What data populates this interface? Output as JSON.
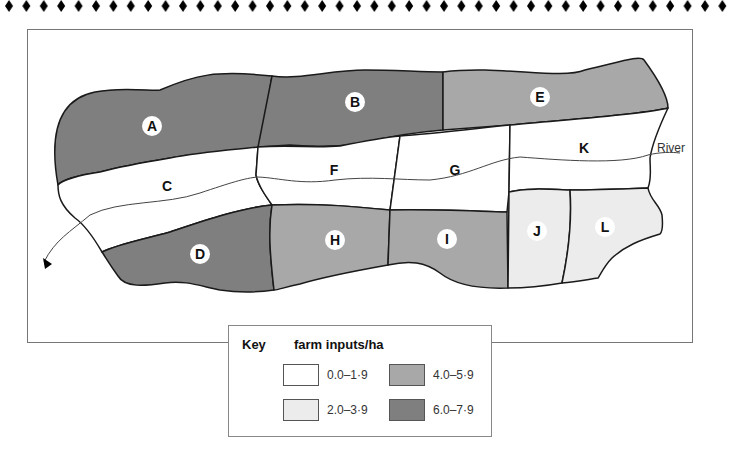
{
  "map": {
    "river_label": "River",
    "regions": [
      {
        "id": "A",
        "label": "A",
        "category": 3,
        "x": 152,
        "y": 126
      },
      {
        "id": "B",
        "label": "B",
        "category": 3,
        "x": 355,
        "y": 102
      },
      {
        "id": "C",
        "label": "C",
        "category": 0,
        "x": 167,
        "y": 186
      },
      {
        "id": "D",
        "label": "D",
        "category": 3,
        "x": 200,
        "y": 254
      },
      {
        "id": "E",
        "label": "E",
        "category": 2,
        "x": 540,
        "y": 97
      },
      {
        "id": "F",
        "label": "F",
        "category": 0,
        "x": 334,
        "y": 170
      },
      {
        "id": "G",
        "label": "G",
        "category": 0,
        "x": 455,
        "y": 170
      },
      {
        "id": "H",
        "label": "H",
        "category": 2,
        "x": 335,
        "y": 240
      },
      {
        "id": "I",
        "label": "I",
        "category": 2,
        "x": 447,
        "y": 239
      },
      {
        "id": "J",
        "label": "J",
        "category": 1,
        "x": 537,
        "y": 231
      },
      {
        "id": "K",
        "label": "K",
        "category": 0,
        "x": 584,
        "y": 148
      },
      {
        "id": "L",
        "label": "L",
        "category": 1,
        "x": 605,
        "y": 227
      }
    ],
    "colors": {
      "cat0": "#ffffff",
      "cat1": "#ececec",
      "cat2": "#a8a8a8",
      "cat3": "#7f7f7f",
      "border": "#1a1a1a",
      "river": "#444444"
    }
  },
  "key": {
    "title": "Key",
    "subtitle": "farm inputs/ha",
    "items": [
      {
        "range": "0.0–1·9",
        "color": "#ffffff"
      },
      {
        "range": "2.0–3·9",
        "color": "#ececec"
      },
      {
        "range": "4.0–5·9",
        "color": "#a8a8a8"
      },
      {
        "range": "6.0–7·9",
        "color": "#7f7f7f"
      }
    ]
  }
}
